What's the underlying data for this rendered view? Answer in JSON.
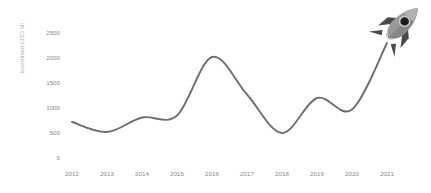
{
  "chart_data": {
    "type": "line",
    "title": "",
    "subtitle": "",
    "xlabel": "",
    "ylabel": "Investment (USD M)",
    "categories": [
      "2012",
      "2013",
      "2014",
      "2015",
      "2016",
      "2017",
      "2018",
      "2019",
      "2020",
      "2021"
    ],
    "values": [
      700,
      500,
      790,
      830,
      2000,
      1250,
      480,
      1180,
      950,
      2280
    ],
    "x": [
      2012,
      2013,
      2014,
      2015,
      2016,
      2017,
      2018,
      2019,
      2020,
      2021
    ],
    "ylim": [
      0,
      2500
    ],
    "xlim": [
      2012,
      2021
    ],
    "yticks": [
      "0",
      "500",
      "1000",
      "1500",
      "2000",
      "2500"
    ],
    "ytick_values": [
      0,
      500,
      1000,
      1500,
      2000,
      2500
    ],
    "xticks": [
      "2012",
      "2013",
      "2014",
      "2015",
      "2016",
      "2017",
      "2018",
      "2019",
      "2020",
      "2021"
    ],
    "grid": false,
    "legend": false,
    "legend_position": "none",
    "series": [
      {
        "name": "Growth",
        "values": [
          700,
          500,
          790,
          830,
          2000,
          1250,
          480,
          1180,
          950,
          2280
        ],
        "color": "#6e6e6e"
      }
    ],
    "annotations": [
      {
        "name": "rocket-icon",
        "label": "rocket",
        "x": 2021,
        "y": 2500,
        "description": "Gray rocket ship pointing up-right at the end of the rising line"
      }
    ]
  },
  "colors": {
    "line": "#6e6e6e",
    "tick_label": "#8a8a8a",
    "axis_title": "#a8a8a8",
    "background": "#ffffff",
    "rocket_body": "#9a9a9a",
    "rocket_body_dark": "#7d7d7d",
    "rocket_fin": "#4a4a4a",
    "rocket_window": "#1c1c1c",
    "rocket_window_ring": "#c9c9c9"
  }
}
